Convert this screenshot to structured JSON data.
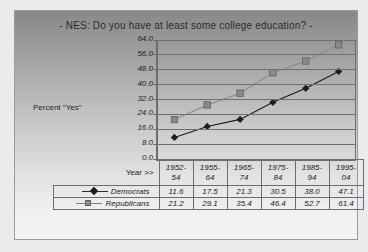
{
  "chart_data": {
    "type": "line",
    "title": "-  NES:  Do you have at least some college education?   -",
    "ylabel": "Percent \"Yes\"",
    "xlabel": "Year >>",
    "categories": [
      "1952-54",
      "1955-64",
      "1965-74",
      "1975-84",
      "1985-94",
      "1995-04"
    ],
    "series": [
      {
        "name": "Democrats",
        "values": [
          11.6,
          17.5,
          21.3,
          30.5,
          38.0,
          47.1
        ],
        "marker": "diamond",
        "color": "#1c1c1c"
      },
      {
        "name": "Republicans",
        "values": [
          21.2,
          29.1,
          35.4,
          46.4,
          52.7,
          61.4
        ],
        "marker": "square",
        "color": "#8a8a8a"
      }
    ],
    "ylim": [
      0,
      64
    ],
    "ytick_labels": [
      "64.0",
      "56.0",
      "48.0",
      "40.0",
      "32.0",
      "24.0",
      "16.0",
      "8.0",
      "0.0"
    ],
    "ytick_step": 8,
    "grid": true,
    "legend_position": "table-row-labels"
  },
  "table": {
    "year_label": "Year >>",
    "year_lines": [
      [
        "1952-",
        "54"
      ],
      [
        "1955-",
        "64"
      ],
      [
        "1965-",
        "74"
      ],
      [
        "1975-",
        "84"
      ],
      [
        "1985-",
        "94"
      ],
      [
        "1995-",
        "04"
      ]
    ],
    "rows": [
      {
        "name": "Democrats",
        "values": [
          "11.6",
          "17.5",
          "21.3",
          "30.5",
          "38.0",
          "47.1"
        ]
      },
      {
        "name": "Republicans",
        "values": [
          "21.2",
          "29.1",
          "35.4",
          "46.4",
          "52.7",
          "61.4"
        ]
      }
    ]
  }
}
